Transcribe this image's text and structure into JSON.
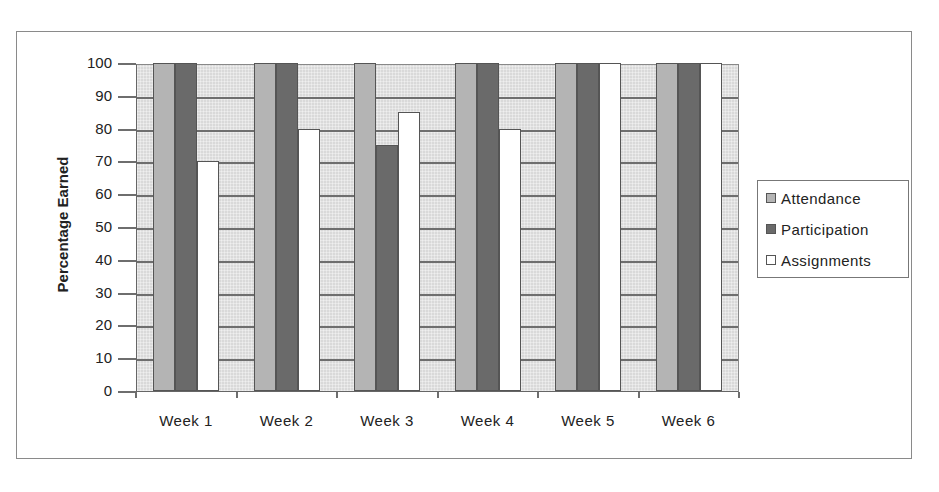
{
  "chart_data": {
    "type": "bar",
    "title": "",
    "xlabel": "",
    "ylabel": "Percentage Earned",
    "ylim": [
      0,
      100
    ],
    "yticks": [
      0,
      10,
      20,
      30,
      40,
      50,
      60,
      70,
      80,
      90,
      100
    ],
    "grid": true,
    "legend_position": "right",
    "categories": [
      "Week 1",
      "Week 2",
      "Week 3",
      "Week 4",
      "Week 5",
      "Week 6"
    ],
    "series": [
      {
        "name": "Attendance",
        "color": "#b4b4b4",
        "values": [
          100,
          100,
          100,
          100,
          100,
          100
        ]
      },
      {
        "name": "Participation",
        "color": "#6a6a6a",
        "values": [
          100,
          100,
          75,
          100,
          100,
          100
        ]
      },
      {
        "name": "Assignments",
        "color": "#ffffff",
        "values": [
          70,
          80,
          85,
          80,
          100,
          100
        ]
      }
    ]
  },
  "axis": {
    "ylabel": "Percentage Earned",
    "yticks": [
      "0",
      "10",
      "20",
      "30",
      "40",
      "50",
      "60",
      "70",
      "80",
      "90",
      "100"
    ],
    "xticks": [
      "Week 1",
      "Week 2",
      "Week 3",
      "Week 4",
      "Week 5",
      "Week 6"
    ]
  },
  "legend": {
    "items": [
      {
        "label": "Attendance",
        "color": "#b4b4b4"
      },
      {
        "label": "Participation",
        "color": "#6a6a6a"
      },
      {
        "label": "Assignments",
        "color": "#ffffff"
      }
    ]
  }
}
